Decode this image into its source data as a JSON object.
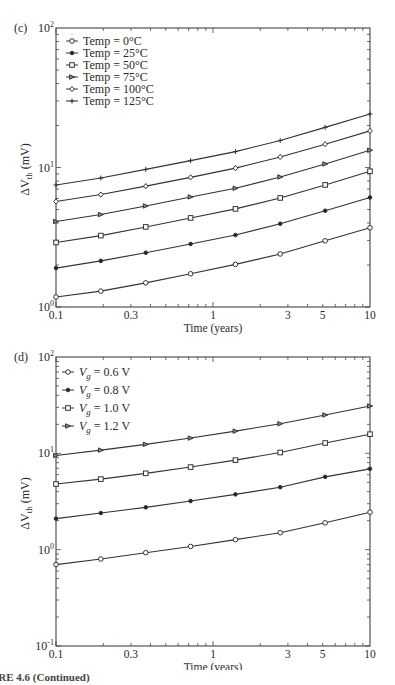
{
  "caption": "IRE 4.6 (Continued)",
  "chart_data": [
    {
      "panel": "(c)",
      "type": "line",
      "xscale": "log",
      "yscale": "log",
      "xlabel": "Time (years)",
      "ylabel": "ΔV_th (mV)",
      "xlim": [
        0.1,
        10
      ],
      "ylim": [
        1,
        100
      ],
      "xticks": [
        "0.1",
        "0.3",
        "1",
        "3",
        "5",
        "10"
      ],
      "yticks": [
        "10^0",
        "10^1",
        "10^2"
      ],
      "legend_position": "upper left",
      "x": [
        0.1,
        0.193,
        0.373,
        0.72,
        1.39,
        2.68,
        5.18,
        10
      ],
      "series": [
        {
          "name": "Temp = 0°C",
          "marker": "open-circle",
          "values": [
            1.18,
            1.3,
            1.49,
            1.73,
            2.02,
            2.4,
            2.98,
            3.7
          ]
        },
        {
          "name": "Temp = 25°C",
          "marker": "filled-dot",
          "values": [
            1.9,
            2.14,
            2.45,
            2.83,
            3.28,
            3.95,
            4.9,
            6.1
          ]
        },
        {
          "name": "Temp = 50°C",
          "marker": "open-square",
          "values": [
            2.9,
            3.25,
            3.75,
            4.35,
            5.05,
            6.05,
            7.5,
            9.4
          ]
        },
        {
          "name": "Temp = 75°C",
          "marker": "triangle",
          "values": [
            4.1,
            4.6,
            5.3,
            6.15,
            7.1,
            8.55,
            10.6,
            13.3
          ]
        },
        {
          "name": "Temp = 100°C",
          "marker": "open-diamond",
          "values": [
            5.7,
            6.4,
            7.35,
            8.5,
            9.9,
            11.9,
            14.7,
            18.3
          ]
        },
        {
          "name": "Temp = 125°C",
          "marker": "plus",
          "values": [
            7.5,
            8.4,
            9.7,
            11.2,
            13.0,
            15.6,
            19.4,
            24.2
          ]
        }
      ]
    },
    {
      "panel": "(d)",
      "type": "line",
      "xscale": "log",
      "yscale": "log",
      "xlabel": "Time (years)",
      "ylabel": "ΔV_th (mV)",
      "xlim": [
        0.1,
        10
      ],
      "ylim": [
        0.1,
        100
      ],
      "xticks": [
        "0.1",
        "0.3",
        "1",
        "3",
        "5",
        "10"
      ],
      "yticks": [
        "10^-1",
        "10^0",
        "10^1",
        "10^2"
      ],
      "legend_position": "upper left",
      "x": [
        0.1,
        0.193,
        0.373,
        0.72,
        1.39,
        2.68,
        5.18,
        10
      ],
      "series": [
        {
          "name": "V_g = 0.6 V",
          "marker": "open-circle",
          "values": [
            0.7,
            0.8,
            0.93,
            1.08,
            1.27,
            1.5,
            1.9,
            2.45
          ]
        },
        {
          "name": "V_g = 0.8 V",
          "marker": "filled-dot",
          "values": [
            2.1,
            2.4,
            2.75,
            3.2,
            3.75,
            4.45,
            5.7,
            6.9
          ]
        },
        {
          "name": "V_g = 1.0 V",
          "marker": "open-square",
          "values": [
            4.8,
            5.4,
            6.2,
            7.2,
            8.5,
            10.2,
            12.8,
            15.8
          ]
        },
        {
          "name": "V_g = 1.2 V",
          "marker": "triangle",
          "values": [
            9.5,
            10.8,
            12.4,
            14.4,
            17.0,
            20.3,
            25.0,
            31.0
          ]
        }
      ]
    }
  ]
}
